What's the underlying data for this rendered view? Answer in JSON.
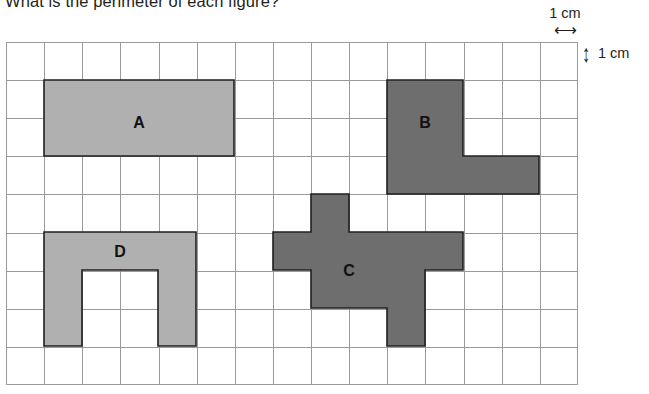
{
  "question": {
    "text": "What is the perimeter of each figure?"
  },
  "legend": {
    "horizontal": {
      "label": "1 cm",
      "arrow_glyph": "⟷",
      "icon": "double-arrow-horizontal-icon"
    },
    "vertical": {
      "label": "1 cm",
      "arrow_glyph": "↕",
      "icon": "double-arrow-vertical-icon"
    }
  },
  "grid": {
    "columns": 15,
    "rows": 9,
    "cell_size_cm": 1,
    "line_color": "#9a9a9a"
  },
  "colors": {
    "fill_light": "#b0b0b0",
    "fill_dark": "#6e6e6e",
    "outline": "#231f20",
    "text": "#231f20"
  },
  "figures": [
    {
      "label": "A",
      "fill": "#b0b0b0",
      "description": "rectangle 6 cm by 2 cm",
      "points": "38,38 228,38 228,114 38,114",
      "label_x": 133,
      "label_y": 80
    },
    {
      "label": "B",
      "fill": "#6e6e6e",
      "description": "L-shape, 2 by 2 upper block with 3 by 1 foot to the right",
      "points": "381,38 457,38 457,114 533,114 533,152 381,152 381,114 381,114",
      "label_x": 419,
      "label_y": 80
    },
    {
      "label": "C",
      "fill": "#6e6e6e",
      "description": "cross / plus shape with offset lower stem",
      "points": "305,152 343,152 343,190 457,190 457,228 419,228 419,304 381,304 381,266 305,266 305,228 267,228 267,190 305,190",
      "label_x": 343,
      "label_y": 228
    },
    {
      "label": "D",
      "fill": "#b0b0b0",
      "description": "U-shape, 4 cm wide and 3 cm tall with 2 by 2 notch",
      "points": "38,190 190,190 190,304 152,304 152,228 76,228 76,304 38,304",
      "label_x": 114,
      "label_y": 209
    }
  ]
}
